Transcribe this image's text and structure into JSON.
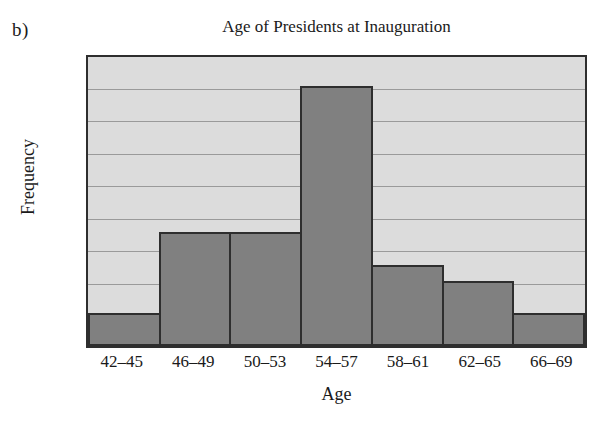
{
  "panel": {
    "label": "b)"
  },
  "chart_data": {
    "type": "bar",
    "title": "Age of Presidents at Inauguration",
    "xlabel": "Age",
    "ylabel": "Frequency",
    "categories": [
      "42–45",
      "46–49",
      "50–53",
      "54–57",
      "58–61",
      "62–65",
      "66–69"
    ],
    "values": [
      2,
      7,
      7,
      16,
      5,
      4,
      2
    ],
    "ylim": [
      0,
      18
    ],
    "ytick_step": 2,
    "yticks": [
      18,
      16,
      14,
      12,
      10,
      8,
      6,
      4,
      2,
      0
    ],
    "grid": true,
    "legend": null,
    "legend_position": "none",
    "colors": {
      "bar_fill": "#808080",
      "bar_border": "#2e2e2e",
      "plot_background": "#dcdcdc",
      "gridline": "#9a9a9a",
      "text": "#1a1a1a",
      "page_background": "#ffffff"
    }
  }
}
